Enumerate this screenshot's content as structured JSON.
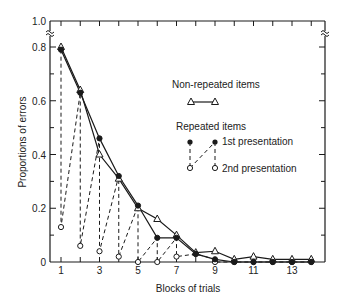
{
  "chart_data": {
    "type": "line",
    "title": "",
    "xlabel": "Blocks of trials",
    "ylabel": "Proportions of errors",
    "xlim": [
      0.5,
      14.5
    ],
    "ylim": [
      0,
      1.0
    ],
    "x_ticks": [
      1,
      3,
      5,
      7,
      9,
      11,
      13
    ],
    "y_ticks": [
      0,
      0.2,
      0.4,
      0.6,
      0.8,
      1.0
    ],
    "y_tick_labels": [
      "0",
      "0.2",
      "0.4",
      "0.6",
      "0.8",
      "1.0"
    ],
    "axis_break": "between 0.8 and 1.0 on y-axis",
    "grid": false,
    "legend_position": "upper right inside plot",
    "x": [
      1,
      2,
      3,
      4,
      5,
      6,
      7,
      8,
      9,
      10,
      11,
      12,
      13,
      14
    ],
    "series": [
      {
        "name": "Non-repeated items",
        "marker": "open-triangle",
        "line": "solid",
        "values": [
          0.8,
          0.64,
          0.4,
          0.31,
          0.2,
          0.16,
          0.1,
          0.035,
          0.04,
          0.01,
          0.02,
          0.01,
          0.01,
          0.01
        ]
      },
      {
        "name": "Repeated items - 1st presentation",
        "marker": "filled-circle",
        "line": "solid",
        "values": [
          0.79,
          0.63,
          0.46,
          0.32,
          0.21,
          0.09,
          0.09,
          0.03,
          0.01,
          0.0,
          0.0,
          0.0,
          0.0,
          0.0
        ]
      },
      {
        "name": "Repeated items - 2nd presentation",
        "marker": "open-circle",
        "line": "dashed",
        "values": [
          0.13,
          0.06,
          0.04,
          0.02,
          0.0,
          0.0,
          0.02,
          0.03,
          0.0,
          0.0,
          0.0,
          0.0,
          0.0,
          0.0
        ]
      }
    ]
  },
  "legend": {
    "non_repeated": "Non-repeated items",
    "repeated": "Repeated items",
    "first": "1st presentation",
    "second": "2nd presentation"
  },
  "axes": {
    "xlabel": "Blocks of trials",
    "ylabel": "Proportions of errors",
    "x_tick_labels": [
      "1",
      "3",
      "5",
      "7",
      "9",
      "11",
      "13"
    ],
    "y_tick_labels": [
      "0",
      "0.2",
      "0.4",
      "0.6",
      "0.8",
      "1.0"
    ]
  }
}
